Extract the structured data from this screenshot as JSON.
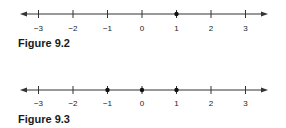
{
  "figures": [
    {
      "caption": "Figure 9.2",
      "ticks": [
        "−3",
        "−2",
        "−1",
        "0",
        "1",
        "2",
        "3"
      ],
      "points": [
        1
      ]
    },
    {
      "caption": "Figure 9.3",
      "ticks": [
        "−3",
        "−2",
        "−1",
        "0",
        "1",
        "2",
        "3"
      ],
      "points": [
        -1,
        0,
        1
      ]
    }
  ],
  "colors": {
    "line": "#333333",
    "text": "#1a1a1a"
  }
}
